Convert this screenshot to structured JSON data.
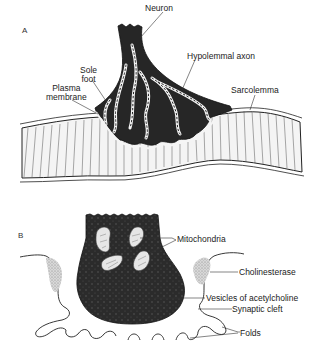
{
  "figure": {
    "panel_a": {
      "letter": "A",
      "labels": {
        "neuron": "Neuron",
        "hypolemmal_axon": "Hypolemmal axon",
        "sole_foot_line1": "Sole",
        "sole_foot_line2": "foot",
        "plasma_membrane_line1": "Plasma",
        "plasma_membrane_line2": "membrane",
        "sarcolemma": "Sarcolemma"
      }
    },
    "panel_b": {
      "letter": "B",
      "labels": {
        "mitochondria": "Mitochondria",
        "cholinesterase": "Cholinesterase",
        "vesicles": "Vesicles of acetylcholine",
        "synaptic_cleft": "Synaptic cleft",
        "folds": "Folds"
      }
    }
  }
}
